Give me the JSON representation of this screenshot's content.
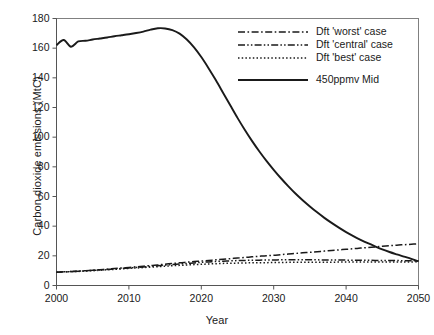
{
  "chart_data": {
    "type": "line",
    "title": "",
    "xlabel": "Year",
    "ylabel": "Carbon dioxide emissions (MtC)",
    "xlim": [
      2000,
      2050
    ],
    "ylim": [
      0,
      180
    ],
    "xticks": [
      "2000",
      "2010",
      "2020",
      "2030",
      "2040",
      "2050"
    ],
    "yticks": [
      "0",
      "20",
      "40",
      "60",
      "80",
      "100",
      "120",
      "140",
      "160",
      "180"
    ],
    "grid": false,
    "legend_position": "top-right",
    "x": [
      2000,
      2001,
      2002,
      2003,
      2004,
      2005,
      2006,
      2007,
      2008,
      2009,
      2010,
      2011,
      2012,
      2013,
      2014,
      2015,
      2016,
      2017,
      2018,
      2019,
      2020,
      2021,
      2022,
      2023,
      2024,
      2025,
      2026,
      2027,
      2028,
      2029,
      2030,
      2031,
      2032,
      2033,
      2034,
      2035,
      2036,
      2037,
      2038,
      2039,
      2040,
      2041,
      2042,
      2043,
      2044,
      2045,
      2046,
      2047,
      2048,
      2049,
      2050
    ],
    "series": [
      {
        "name": "Dft 'worst' case",
        "style": "dash-dot",
        "color": "#1a1a1a",
        "values": [
          9.0,
          9.2,
          9.4,
          9.7,
          10.0,
          10.3,
          10.7,
          11.0,
          11.4,
          11.8,
          12.2,
          12.6,
          13.0,
          13.5,
          13.9,
          14.4,
          14.8,
          15.3,
          15.7,
          16.1,
          16.5,
          16.9,
          17.3,
          17.7,
          18.1,
          18.5,
          18.9,
          19.3,
          19.7,
          20.1,
          20.4,
          20.8,
          21.2,
          21.6,
          22.0,
          22.4,
          22.8,
          23.2,
          23.6,
          24.0,
          24.4,
          24.8,
          25.2,
          25.6,
          26.0,
          26.4,
          26.8,
          27.2,
          27.5,
          27.8,
          28.1
        ]
      },
      {
        "name": "Dft 'central' case",
        "style": "dash-dot-dot",
        "color": "#1a1a1a",
        "values": [
          9.0,
          9.2,
          9.4,
          9.6,
          9.9,
          10.2,
          10.5,
          10.8,
          11.1,
          11.5,
          11.8,
          12.2,
          12.5,
          12.9,
          13.3,
          13.7,
          14.1,
          14.5,
          14.9,
          15.2,
          15.6,
          15.9,
          16.2,
          16.4,
          16.6,
          16.8,
          16.9,
          17.0,
          17.1,
          17.2,
          17.2,
          17.3,
          17.3,
          17.3,
          17.3,
          17.3,
          17.3,
          17.2,
          17.2,
          17.2,
          17.1,
          17.1,
          17.0,
          17.0,
          16.9,
          16.9,
          16.8,
          16.8,
          16.7,
          16.7,
          16.6
        ]
      },
      {
        "name": "Dft 'best' case",
        "style": "dotted",
        "color": "#1a1a1a",
        "values": [
          9.0,
          9.2,
          9.3,
          9.5,
          9.8,
          10.0,
          10.3,
          10.6,
          10.9,
          11.2,
          11.5,
          11.8,
          12.1,
          12.4,
          12.7,
          13.0,
          13.3,
          13.6,
          13.8,
          14.1,
          14.3,
          14.5,
          14.7,
          14.9,
          15.0,
          15.1,
          15.2,
          15.3,
          15.4,
          15.4,
          15.5,
          15.5,
          15.6,
          15.6,
          15.6,
          15.7,
          15.7,
          15.7,
          15.7,
          15.8,
          15.8,
          15.8,
          15.8,
          15.8,
          15.9,
          15.9,
          15.9,
          15.9,
          15.9,
          15.9,
          16.0
        ]
      },
      {
        "name": "450ppmv Mid",
        "style": "solid",
        "color": "#1a1a1a",
        "values": [
          162.0,
          165.5,
          161.0,
          164.5,
          165.0,
          165.8,
          166.5,
          167.2,
          168.0,
          168.7,
          169.4,
          170.2,
          171.2,
          172.5,
          173.4,
          173.3,
          172.2,
          169.8,
          165.8,
          160.5,
          154.0,
          146.5,
          138.5,
          130.0,
          121.5,
          113.0,
          105.0,
          97.5,
          90.5,
          84.0,
          78.0,
          72.3,
          67.0,
          62.0,
          57.5,
          53.3,
          49.3,
          45.6,
          42.2,
          39.0,
          36.0,
          33.3,
          30.8,
          28.5,
          26.4,
          24.4,
          22.6,
          21.0,
          19.5,
          18.0,
          16.3
        ]
      }
    ]
  },
  "legend": {
    "items": [
      {
        "label": "Dft 'worst' case",
        "style": "dash-dot"
      },
      {
        "label": "Dft 'central' case",
        "style": "dash-dot-dot"
      },
      {
        "label": "Dft 'best' case",
        "style": "dotted"
      },
      {
        "label": "450ppmv Mid",
        "style": "solid"
      }
    ]
  },
  "axes": {
    "x_title": "Year",
    "y_title": "Carbon dioxide emissions (MtC)"
  }
}
